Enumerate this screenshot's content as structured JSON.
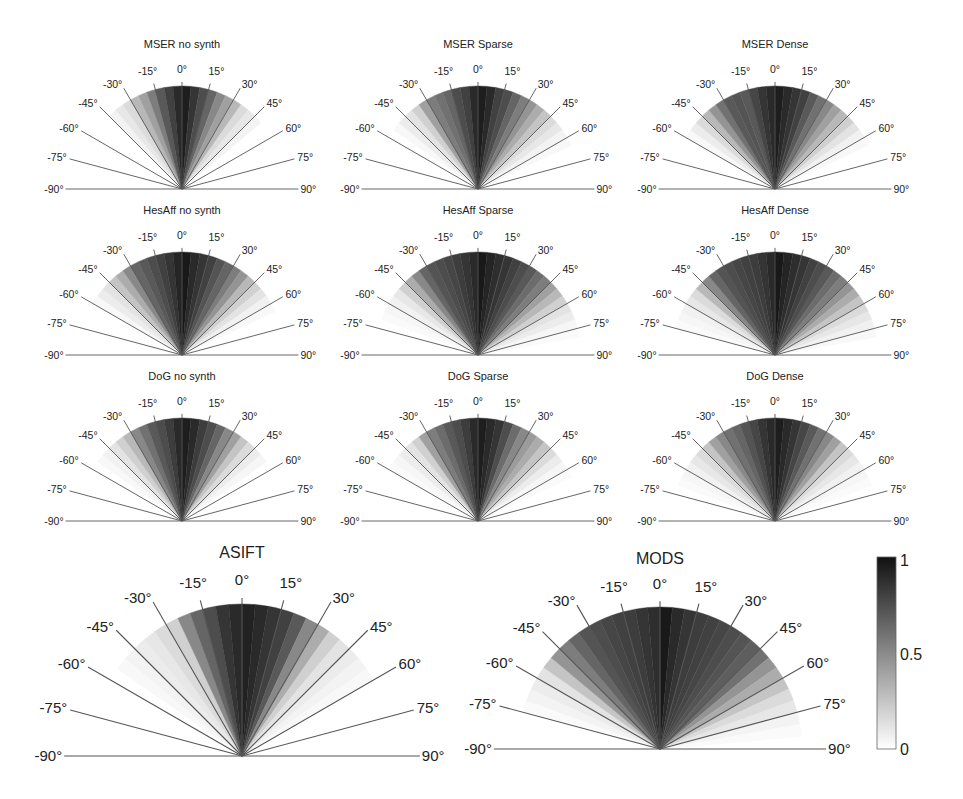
{
  "chart_data": {
    "type": "polar-sector-heatmap",
    "angle_bins_deg": [
      -90,
      -85,
      -80,
      -75,
      -70,
      -65,
      -60,
      -55,
      -50,
      -45,
      -40,
      -35,
      -30,
      -25,
      -20,
      -15,
      -10,
      -5,
      0,
      5,
      10,
      15,
      20,
      25,
      30,
      35,
      40,
      45,
      50,
      55,
      60,
      65,
      70,
      75,
      80,
      85
    ],
    "bin_width_deg": 5,
    "tick_labels": [
      "-90°",
      "-75°",
      "-60°",
      "-45°",
      "-30°",
      "-15°",
      "0°",
      "15°",
      "30°",
      "45°",
      "60°",
      "75°",
      "90°"
    ],
    "colorbar": {
      "min": 0,
      "max": 1,
      "ticks": [
        "0",
        "0.5",
        "1"
      ],
      "colormap": "gray_reversed"
    },
    "plots": [
      {
        "title": "MSER no synth",
        "cx": 182,
        "cy": 189,
        "r": 103,
        "size": "small",
        "values": [
          0,
          0,
          0,
          0,
          0,
          0,
          0,
          0,
          0,
          0.05,
          0.1,
          0.15,
          0.3,
          0.4,
          0.55,
          0.7,
          0.8,
          0.9,
          0.95,
          0.85,
          0.75,
          0.65,
          0.5,
          0.4,
          0.3,
          0.15,
          0.1,
          0.05,
          0,
          0,
          0,
          0,
          0,
          0,
          0,
          0
        ]
      },
      {
        "title": "MSER Sparse",
        "cx": 478,
        "cy": 189,
        "r": 103,
        "size": "small",
        "values": [
          0,
          0,
          0,
          0,
          0,
          0,
          0,
          0.03,
          0.08,
          0.12,
          0.2,
          0.4,
          0.55,
          0.6,
          0.65,
          0.75,
          0.8,
          0.9,
          0.95,
          0.9,
          0.8,
          0.75,
          0.65,
          0.55,
          0.45,
          0.35,
          0.25,
          0.15,
          0.1,
          0.05,
          0.03,
          0,
          0,
          0,
          0,
          0
        ]
      },
      {
        "title": "MSER Dense",
        "cx": 775,
        "cy": 189,
        "r": 103,
        "size": "small",
        "values": [
          0,
          0,
          0,
          0,
          0,
          0,
          0.03,
          0.08,
          0.15,
          0.3,
          0.45,
          0.6,
          0.7,
          0.72,
          0.7,
          0.78,
          0.85,
          0.9,
          0.95,
          0.9,
          0.85,
          0.8,
          0.7,
          0.6,
          0.5,
          0.4,
          0.3,
          0.2,
          0.12,
          0.06,
          0.03,
          0,
          0,
          0,
          0,
          0
        ]
      },
      {
        "title": "HesAff no synth",
        "cx": 182,
        "cy": 355,
        "r": 103,
        "size": "small",
        "values": [
          0,
          0,
          0,
          0,
          0,
          0,
          0.03,
          0.08,
          0.12,
          0.25,
          0.35,
          0.5,
          0.65,
          0.7,
          0.75,
          0.8,
          0.85,
          0.92,
          0.97,
          0.9,
          0.85,
          0.8,
          0.72,
          0.65,
          0.55,
          0.45,
          0.3,
          0.2,
          0.12,
          0.06,
          0.03,
          0,
          0,
          0,
          0,
          0
        ]
      },
      {
        "title": "HesAff Sparse",
        "cx": 478,
        "cy": 355,
        "r": 103,
        "size": "small",
        "values": [
          0,
          0,
          0,
          0,
          0.02,
          0.04,
          0.06,
          0.1,
          0.2,
          0.35,
          0.5,
          0.65,
          0.72,
          0.75,
          0.78,
          0.82,
          0.85,
          0.9,
          0.97,
          0.92,
          0.88,
          0.85,
          0.8,
          0.75,
          0.7,
          0.62,
          0.55,
          0.4,
          0.3,
          0.2,
          0.12,
          0.08,
          0.04,
          0.02,
          0,
          0
        ]
      },
      {
        "title": "HesAff Dense",
        "cx": 775,
        "cy": 355,
        "r": 103,
        "size": "small",
        "values": [
          0,
          0,
          0,
          0.02,
          0.04,
          0.06,
          0.1,
          0.15,
          0.3,
          0.5,
          0.65,
          0.72,
          0.75,
          0.78,
          0.8,
          0.82,
          0.85,
          0.9,
          0.97,
          0.92,
          0.88,
          0.85,
          0.8,
          0.75,
          0.7,
          0.62,
          0.55,
          0.45,
          0.35,
          0.25,
          0.15,
          0.1,
          0.06,
          0.03,
          0,
          0
        ]
      },
      {
        "title": "DoG no synth",
        "cx": 182,
        "cy": 521,
        "r": 103,
        "size": "small",
        "values": [
          0,
          0,
          0,
          0,
          0,
          0,
          0,
          0.03,
          0.06,
          0.12,
          0.2,
          0.3,
          0.5,
          0.6,
          0.7,
          0.75,
          0.82,
          0.9,
          0.95,
          0.9,
          0.82,
          0.75,
          0.65,
          0.5,
          0.4,
          0.25,
          0.15,
          0.08,
          0.04,
          0,
          0,
          0,
          0,
          0,
          0,
          0
        ]
      },
      {
        "title": "DoG Sparse",
        "cx": 478,
        "cy": 521,
        "r": 103,
        "size": "small",
        "values": [
          0,
          0,
          0,
          0,
          0,
          0,
          0.02,
          0.04,
          0.08,
          0.12,
          0.2,
          0.4,
          0.55,
          0.62,
          0.7,
          0.75,
          0.82,
          0.9,
          0.95,
          0.9,
          0.85,
          0.75,
          0.62,
          0.5,
          0.42,
          0.35,
          0.25,
          0.15,
          0.08,
          0.04,
          0.02,
          0,
          0,
          0,
          0,
          0
        ]
      },
      {
        "title": "DoG Dense",
        "cx": 775,
        "cy": 521,
        "r": 103,
        "size": "small",
        "values": [
          0,
          0,
          0,
          0,
          0.02,
          0.04,
          0.06,
          0.1,
          0.15,
          0.25,
          0.4,
          0.5,
          0.6,
          0.65,
          0.72,
          0.78,
          0.85,
          0.9,
          0.95,
          0.9,
          0.85,
          0.78,
          0.7,
          0.6,
          0.5,
          0.4,
          0.25,
          0.15,
          0.1,
          0.06,
          0.04,
          0.02,
          0,
          0,
          0,
          0
        ]
      },
      {
        "title": "ASIFT",
        "cx": 242,
        "cy": 756,
        "r": 152,
        "size": "large",
        "values": [
          0,
          0,
          0,
          0,
          0,
          0,
          0,
          0.03,
          0.05,
          0.08,
          0.1,
          0.15,
          0.2,
          0.5,
          0.65,
          0.75,
          0.85,
          0.9,
          0.93,
          0.9,
          0.85,
          0.8,
          0.7,
          0.5,
          0.35,
          0.2,
          0.12,
          0.08,
          0.05,
          0.03,
          0,
          0,
          0,
          0,
          0,
          0
        ]
      },
      {
        "title": "MODS",
        "cx": 660,
        "cy": 749,
        "r": 142,
        "size": "large",
        "values": [
          0,
          0,
          0,
          0.02,
          0.05,
          0.08,
          0.12,
          0.25,
          0.45,
          0.55,
          0.65,
          0.72,
          0.75,
          0.78,
          0.8,
          0.82,
          0.85,
          0.88,
          0.97,
          0.9,
          0.85,
          0.82,
          0.8,
          0.78,
          0.75,
          0.72,
          0.68,
          0.6,
          0.45,
          0.35,
          0.25,
          0.15,
          0.1,
          0.05,
          0.02,
          0
        ]
      }
    ]
  },
  "figure": {
    "colorbar_ticks": {
      "top": "1",
      "mid": "0.5",
      "bottom": "0"
    }
  }
}
